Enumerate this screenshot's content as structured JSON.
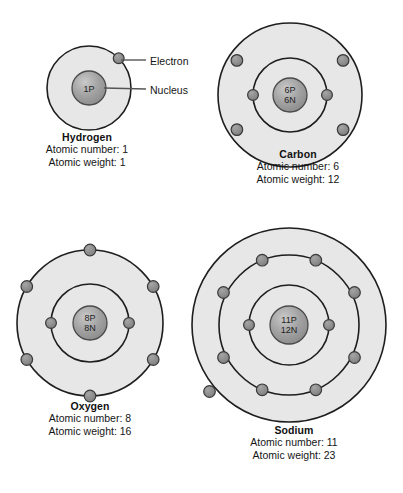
{
  "diagram": {
    "callouts": {
      "electron": "Electron",
      "nucleus": "Nucleus"
    },
    "colors": {
      "shell_fill": "#e7e7e7",
      "shell_stroke": "#1e1e1e",
      "electron_fill": "#8a8a8a",
      "electron_stroke": "#3a3a3a",
      "nucleus_fill": "#9a9a9a",
      "nucleus_stroke": "#4a4a4a",
      "text": "#151515",
      "background": "#ffffff"
    },
    "atoms": [
      {
        "id": "hydrogen",
        "name": "Hydrogen",
        "atomic_number_line": "Atomic number: 1",
        "atomic_weight_line": "Atomic weight: 1",
        "atomic_number": 1,
        "atomic_weight": 1,
        "nucleus_protons": "1P",
        "nucleus_neutrons": "",
        "shells": [
          {
            "electrons": 1
          }
        ]
      },
      {
        "id": "carbon",
        "name": "Carbon",
        "atomic_number_line": "Atomic number: 6",
        "atomic_weight_line": "Atomic weight: 12",
        "atomic_number": 6,
        "atomic_weight": 12,
        "nucleus_protons": "6P",
        "nucleus_neutrons": "6N",
        "shells": [
          {
            "electrons": 2
          },
          {
            "electrons": 4
          }
        ]
      },
      {
        "id": "oxygen",
        "name": "Oxygen",
        "atomic_number_line": "Atomic number: 8",
        "atomic_weight_line": "Atomic weight: 16",
        "atomic_number": 8,
        "atomic_weight": 16,
        "nucleus_protons": "8P",
        "nucleus_neutrons": "8N",
        "shells": [
          {
            "electrons": 2
          },
          {
            "electrons": 6
          }
        ]
      },
      {
        "id": "sodium",
        "name": "Sodium",
        "atomic_number_line": "Atomic number: 11",
        "atomic_weight_line": "Atomic weight: 23",
        "atomic_number": 11,
        "atomic_weight": 23,
        "nucleus_protons": "11P",
        "nucleus_neutrons": "12N",
        "shells": [
          {
            "electrons": 2
          },
          {
            "electrons": 8
          },
          {
            "electrons": 1
          }
        ]
      }
    ]
  }
}
